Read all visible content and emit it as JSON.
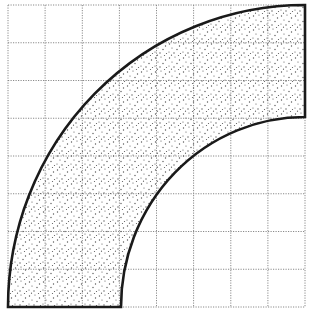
{
  "diagram": {
    "grid": {
      "columns": 8,
      "rows": 8,
      "left": 8,
      "top": 5,
      "right": 305,
      "bottom": 307,
      "line_style": "dotted",
      "line_color": "#8a8a8a"
    },
    "shape": {
      "type": "quarter-annulus",
      "center_corner": "bottom-right",
      "outer_radius_cells": 8,
      "inner_radius_cells": 5,
      "fill": "stipple",
      "stroke_color": "#1a1a1a",
      "dot_color": "#555555"
    }
  }
}
